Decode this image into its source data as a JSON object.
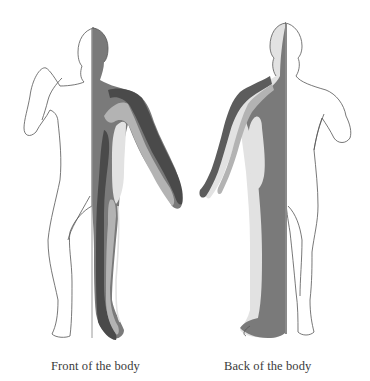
{
  "diagram": {
    "type": "meridian-body-diagram",
    "figures": [
      {
        "id": "front",
        "caption": "Front of the body",
        "view": "anterior",
        "shaded_side": "right half of image figure (subject's left side)"
      },
      {
        "id": "back",
        "caption": "Back of the body",
        "view": "posterior",
        "shaded_side": "left half of image figure"
      }
    ],
    "colors": {
      "outline": "#555555",
      "dark_band": "#4a4a4a",
      "mid_band": "#7a7a7a",
      "light_band": "#b3b3b3",
      "pale_band": "#e2e2e2",
      "background": "#ffffff",
      "caption_text": "#3a3a3a"
    }
  }
}
